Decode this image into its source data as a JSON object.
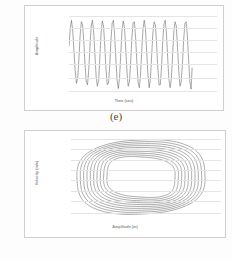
{
  "figure": {
    "panels": [
      {
        "caption": "(e)",
        "chart_ref": 0
      },
      {
        "caption": "(g)",
        "chart_ref": 1
      }
    ]
  },
  "chart_data": [
    {
      "type": "line",
      "title": "",
      "xlabel": "Time (sec)",
      "ylabel": "Amplitude",
      "xlim": [
        0,
        12
      ],
      "ylim": [
        -1.002478,
        0.075226
      ],
      "grid": true,
      "legend": "none",
      "xticks": [
        "0",
        "2",
        "4",
        "6",
        "8",
        "10",
        "12"
      ],
      "xtick_values": [
        0,
        2,
        4,
        6,
        8,
        10,
        12
      ],
      "yticks": [
        "0.075226",
        "0.025226",
        "-0.075226",
        "-0.224774",
        "-0.424774",
        "-0.674774",
        "-1.002478"
      ],
      "ytick_values": [
        0.075226,
        0.025226,
        -0.075226,
        -0.224774,
        -0.424774,
        -0.674774,
        -1.002478
      ],
      "series": [
        {
          "name": "amplitude",
          "description": "modulated oscillation with beating envelope, approximately 14 cycles over 0 to 10 seconds",
          "x": [
            0.0,
            0.1,
            0.2,
            0.3,
            0.4,
            0.5,
            0.6,
            0.7,
            0.8,
            0.9,
            1.0,
            1.1,
            1.2,
            1.3,
            1.4,
            1.5,
            1.6,
            1.7,
            1.8,
            1.9,
            2.0,
            2.1,
            2.2,
            2.3,
            2.4,
            2.5,
            2.6,
            2.7,
            2.8,
            2.9,
            3.0,
            3.1,
            3.2,
            3.3,
            3.4,
            3.5,
            3.6,
            3.7,
            3.8,
            3.9,
            4.0,
            4.1,
            4.2,
            4.3,
            4.4,
            4.5,
            4.6,
            4.7,
            4.8,
            4.9,
            5.0,
            5.1,
            5.2,
            5.3,
            5.4,
            5.5,
            5.6,
            5.7,
            5.8,
            5.9,
            6.0,
            6.1,
            6.2,
            6.3,
            6.4,
            6.5,
            6.6,
            6.7,
            6.8,
            6.9,
            7.0,
            7.1,
            7.2,
            7.3,
            7.4,
            7.5,
            7.6,
            7.7,
            7.8,
            7.9,
            8.0,
            8.1,
            8.2,
            8.3,
            8.4,
            8.5,
            8.6,
            8.7,
            8.8,
            8.9,
            9.0,
            9.1,
            9.2,
            9.3,
            9.4,
            9.5,
            9.6,
            9.7,
            9.8,
            9.9,
            10.0
          ],
          "y": [
            -0.36,
            -0.12,
            0.0,
            -0.14,
            -0.42,
            -0.7,
            -0.88,
            -0.82,
            -0.55,
            -0.22,
            -0.02,
            -0.06,
            -0.3,
            -0.62,
            -0.86,
            -0.9,
            -0.7,
            -0.36,
            -0.08,
            0.0,
            -0.16,
            -0.48,
            -0.78,
            -0.92,
            -0.84,
            -0.52,
            -0.18,
            -0.01,
            -0.08,
            -0.36,
            -0.68,
            -0.9,
            -0.88,
            -0.64,
            -0.28,
            -0.04,
            0.0,
            -0.2,
            -0.54,
            -0.84,
            -0.95,
            -0.8,
            -0.46,
            -0.14,
            -0.01,
            -0.1,
            -0.4,
            -0.72,
            -0.92,
            -0.86,
            -0.58,
            -0.24,
            -0.03,
            -0.02,
            -0.24,
            -0.58,
            -0.86,
            -0.94,
            -0.76,
            -0.42,
            -0.12,
            0.0,
            -0.12,
            -0.44,
            -0.76,
            -0.94,
            -0.82,
            -0.5,
            -0.18,
            -0.02,
            -0.06,
            -0.32,
            -0.66,
            -0.9,
            -0.9,
            -0.66,
            -0.3,
            -0.05,
            0.0,
            -0.18,
            -0.52,
            -0.82,
            -0.94,
            -0.82,
            -0.48,
            -0.16,
            -0.02,
            -0.08,
            -0.38,
            -0.7,
            -0.92,
            -0.86,
            -0.6,
            -0.26,
            -0.04,
            -0.02,
            -0.22,
            -0.56,
            -0.86,
            -0.96,
            -0.6
          ]
        }
      ]
    },
    {
      "type": "line",
      "title": "",
      "xlabel": "Amplitude (m)",
      "ylabel": "Velocity (m/s)",
      "xlim": [
        -0.52211,
        0.11112
      ],
      "ylim": [
        -1.60529,
        1.855742
      ],
      "grid": true,
      "legend": "none",
      "xticks": [
        "-0.522110",
        "-0.416710",
        "-0.310470",
        "-0.205620",
        "-0.101620",
        "0.005620",
        "0.111120"
      ],
      "xtick_values": [
        -0.52211,
        -0.41671,
        -0.31047,
        -0.20562,
        -0.10162,
        0.00562,
        0.11112
      ],
      "yticks": [
        "1.855742",
        "1.564742",
        "0.894742",
        "0.364742",
        "0.115206",
        "-1.145206",
        "-1.125290",
        "-1.605290"
      ],
      "ytick_values": [
        1.855742,
        1.564742,
        0.894742,
        0.364742,
        0.115206,
        -1.145206,
        -1.12529,
        -1.60529
      ],
      "series": [
        {
          "name": "phase-portrait-orbits",
          "description": "nested diamond/lens shaped limit cycle orbits, approximately 10 overlapping loops spiraling outward",
          "loop_count": 10,
          "shape": "diamond-lens"
        }
      ]
    }
  ]
}
